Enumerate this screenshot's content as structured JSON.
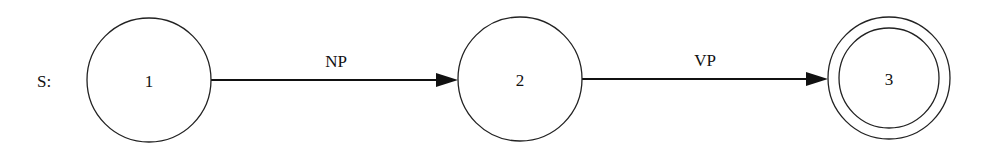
{
  "diagram": {
    "type": "finite-state-network",
    "start_label": "S:",
    "nodes": [
      {
        "id": "1",
        "label": "1",
        "cx": 149,
        "cy": 80,
        "r": 62,
        "final": false
      },
      {
        "id": "2",
        "label": "2",
        "cx": 520,
        "cy": 79,
        "r": 62,
        "final": false
      },
      {
        "id": "3",
        "label": "3",
        "cx": 889,
        "cy": 78,
        "r": 61,
        "inner_r": 50,
        "final": true
      }
    ],
    "edges": [
      {
        "from": "1",
        "to": "2",
        "label": "NP"
      },
      {
        "from": "2",
        "to": "3",
        "label": "VP"
      }
    ]
  }
}
